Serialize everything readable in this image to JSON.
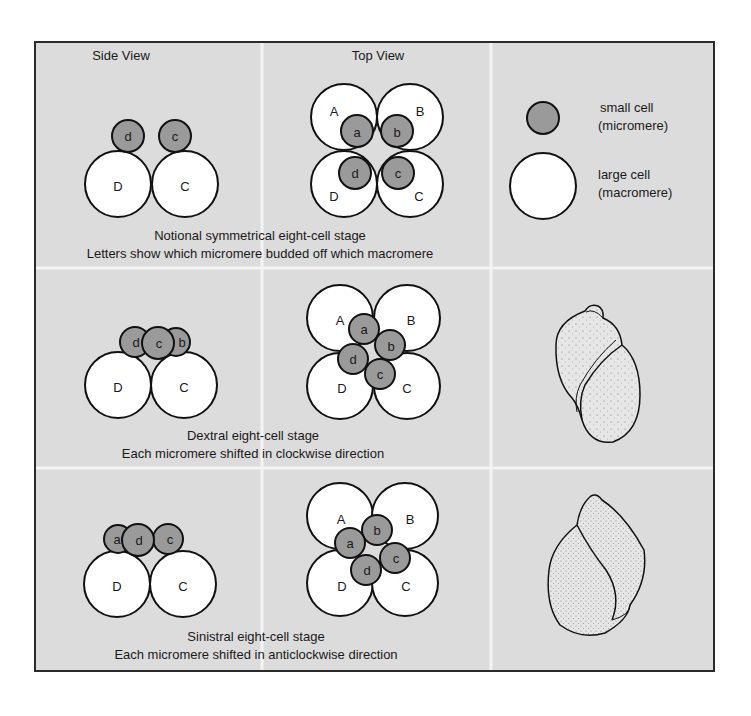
{
  "headers": {
    "side_view": "Side View",
    "top_view": "Top View"
  },
  "legend": {
    "small_cell_line1": "small cell",
    "small_cell_line2": "(micromere)",
    "large_cell_line1": "large cell",
    "large_cell_line2": "(macromere)"
  },
  "rows": [
    {
      "caption_line1": "Notional symmetrical eight-cell stage",
      "caption_line2": "Letters show which micromere budded off which macromere",
      "side_macromeres": [
        "D",
        "C"
      ],
      "side_micromeres": [
        "d",
        "c"
      ],
      "top_macromeres": [
        "A",
        "B",
        "D",
        "C"
      ],
      "top_micromeres": [
        "a",
        "b",
        "d",
        "c"
      ]
    },
    {
      "caption_line1": "Dextral eight-cell stage",
      "caption_line2": "Each micromere shifted in clockwise direction",
      "side_macromeres": [
        "D",
        "C"
      ],
      "side_micromeres": [
        "d",
        "c",
        "b"
      ],
      "top_macromeres": [
        "A",
        "B",
        "D",
        "C"
      ],
      "top_micromeres": [
        "a",
        "b",
        "d",
        "c"
      ],
      "shell": "dextral-shell"
    },
    {
      "caption_line1": "Sinistral eight-cell stage",
      "caption_line2": "Each micromere shifted in anticlockwise direction",
      "side_macromeres": [
        "D",
        "C"
      ],
      "side_micromeres": [
        "a",
        "d",
        "c"
      ],
      "top_macromeres": [
        "A",
        "B",
        "D",
        "C"
      ],
      "top_micromeres": [
        "a",
        "b",
        "c",
        "d"
      ],
      "shell": "sinistral-shell"
    }
  ],
  "colors": {
    "panel_bg": "#dcdcdc",
    "grid_line": "#f4f4f4",
    "frame": "#2a2a2a",
    "micromere_fill": "#9a9a9a",
    "macromere_fill": "#ffffff"
  }
}
